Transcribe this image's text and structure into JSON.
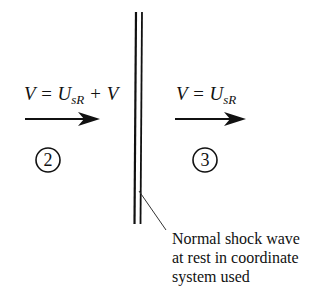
{
  "diagram": {
    "region_upstream": {
      "equation_main": "V = U",
      "equation_sub": "sR",
      "equation_tail": " + V",
      "station": "2"
    },
    "region_downstream": {
      "equation_main": "V = U",
      "equation_sub": "sR",
      "station": "3"
    },
    "shock_label": {
      "line1": "Normal shock wave",
      "line2": "at rest in coordinate",
      "line3": "system used"
    },
    "colors": {
      "ink": "#111111",
      "background": "#ffffff"
    }
  }
}
